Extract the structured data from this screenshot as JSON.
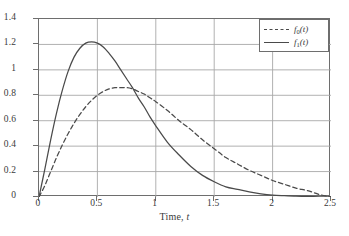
{
  "chart_data": {
    "type": "line",
    "title": "",
    "xlabel": "Time, t",
    "ylabel": "",
    "xlim": [
      0,
      2.5
    ],
    "ylim": [
      0,
      1.4
    ],
    "grid": true,
    "legend_position": "top-right",
    "xticks": [
      "0",
      "0.5",
      "1",
      "1.5",
      "2",
      "2.5"
    ],
    "xtick_values": [
      0,
      0.5,
      1,
      1.5,
      2,
      2.5
    ],
    "yticks": [
      "0",
      "0.2",
      "0.4",
      "0.6",
      "0.8",
      "1",
      "1.2",
      "1.4"
    ],
    "ytick_values": [
      0,
      0.2,
      0.4,
      0.6,
      0.8,
      1.0,
      1.2,
      1.4
    ],
    "series": [
      {
        "name": "f0(t)",
        "label_main": "f",
        "label_sub": "0",
        "label_arg": "(t)",
        "style": "dashed",
        "color": "#4a4a4a",
        "peak_x": 0.72,
        "peak_y": 0.86,
        "x": [
          0,
          0.05,
          0.1,
          0.15,
          0.2,
          0.25,
          0.3,
          0.35,
          0.4,
          0.45,
          0.5,
          0.55,
          0.6,
          0.65,
          0.7,
          0.75,
          0.8,
          0.85,
          0.9,
          0.95,
          1.0,
          1.1,
          1.2,
          1.3,
          1.4,
          1.5,
          1.6,
          1.7,
          1.8,
          1.9,
          2.0,
          2.1,
          2.2,
          2.3,
          2.4,
          2.5
        ],
        "values": [
          0,
          0.09,
          0.2,
          0.31,
          0.41,
          0.5,
          0.58,
          0.65,
          0.71,
          0.76,
          0.8,
          0.83,
          0.85,
          0.86,
          0.86,
          0.86,
          0.85,
          0.83,
          0.81,
          0.78,
          0.75,
          0.68,
          0.6,
          0.53,
          0.45,
          0.38,
          0.31,
          0.26,
          0.21,
          0.17,
          0.13,
          0.1,
          0.07,
          0.05,
          0.02,
          0.0
        ]
      },
      {
        "name": "f1(t)",
        "label_main": "f",
        "label_sub": "1",
        "label_arg": "(t)",
        "style": "solid",
        "color": "#4a4a4a",
        "peak_x": 0.5,
        "peak_y": 1.21,
        "x": [
          0,
          0.05,
          0.1,
          0.15,
          0.2,
          0.25,
          0.3,
          0.35,
          0.4,
          0.45,
          0.5,
          0.55,
          0.6,
          0.65,
          0.7,
          0.75,
          0.8,
          0.85,
          0.9,
          0.95,
          1.0,
          1.1,
          1.2,
          1.3,
          1.4,
          1.5,
          1.6,
          1.7,
          1.8,
          1.9,
          2.0,
          2.1,
          2.2,
          2.3,
          2.4,
          2.5
        ],
        "values": [
          0,
          0.22,
          0.45,
          0.66,
          0.84,
          0.99,
          1.1,
          1.17,
          1.21,
          1.22,
          1.21,
          1.18,
          1.13,
          1.07,
          1.0,
          0.93,
          0.86,
          0.78,
          0.71,
          0.63,
          0.56,
          0.43,
          0.33,
          0.24,
          0.17,
          0.12,
          0.08,
          0.06,
          0.04,
          0.025,
          0.015,
          0.01,
          0.006,
          0.004,
          0.002,
          0.001
        ]
      }
    ],
    "annotations": {
      "crossing_point": {
        "x": 0.85,
        "y": 0.82
      }
    }
  },
  "colors": {
    "grid": "#a8a8a8",
    "frame": "#6e6e6e",
    "curve": "#4a4a4a",
    "text": "#3a3a3a",
    "background": "#ffffff"
  }
}
